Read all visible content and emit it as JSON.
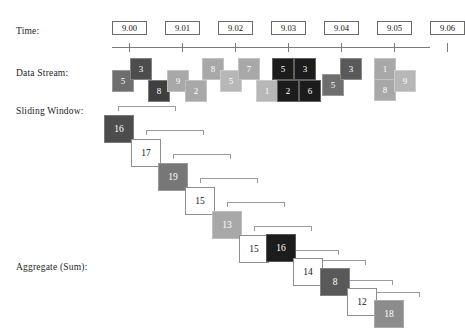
{
  "labels": {
    "time": "Time:",
    "data_stream": "Data Stream:",
    "sliding_window": "Sliding Window:",
    "aggregate": "Aggregate (Sum):"
  },
  "colors": {
    "very_dark": "#1c1c1c",
    "dark": "#3f3f3f",
    "mid_dark": "#595959",
    "mid": "#6e6e6e",
    "gray": "#8c8c8c",
    "light": "#a8a8a8",
    "lighter": "#b7b7b7",
    "axis": "#7a7a7a",
    "box_border": "#6a6a6a",
    "bracket": "#9a9a9a",
    "text_light": "#ffffff",
    "text_dark": "#141414",
    "background": "#ffffff"
  },
  "time_axis": {
    "ticks": [
      "9.00",
      "9.01",
      "9.02",
      "9.03",
      "9.04",
      "9.05",
      "9.06"
    ]
  },
  "chart_data": {
    "type": "diagram",
    "stream_values": [
      5,
      3,
      8,
      9,
      2,
      8,
      5,
      7,
      1,
      5,
      3,
      2,
      6,
      5,
      3,
      1,
      8,
      9
    ],
    "aggregate_values": [
      16,
      17,
      19,
      15,
      13,
      15,
      16,
      14,
      8,
      12,
      18
    ],
    "time_ticks": [
      "9.00",
      "9.01",
      "9.02",
      "9.03",
      "9.04",
      "9.05",
      "9.06"
    ]
  },
  "stream_blocks": [
    {
      "value": "5",
      "x": 112,
      "y": 70,
      "color": "#6e6e6e",
      "text": "#ffffff"
    },
    {
      "value": "3",
      "x": 130,
      "y": 58,
      "color": "#4d4d4d",
      "text": "#ffffff"
    },
    {
      "value": "8",
      "x": 148,
      "y": 80,
      "color": "#3f3f3f",
      "text": "#ffffff"
    },
    {
      "value": "9",
      "x": 167,
      "y": 70,
      "color": "#a8a8a8",
      "text": "#ffffff"
    },
    {
      "value": "2",
      "x": 185,
      "y": 80,
      "color": "#a8a8a8",
      "text": "#ffffff"
    },
    {
      "value": "8",
      "x": 202,
      "y": 58,
      "color": "#a8a8a8",
      "text": "#ffffff"
    },
    {
      "value": "5",
      "x": 220,
      "y": 70,
      "color": "#b7b7b7",
      "text": "#ffffff"
    },
    {
      "value": "7",
      "x": 238,
      "y": 58,
      "color": "#a8a8a8",
      "text": "#ffffff"
    },
    {
      "value": "1",
      "x": 256,
      "y": 80,
      "color": "#b7b7b7",
      "text": "#ffffff"
    },
    {
      "value": "5",
      "x": 272,
      "y": 58,
      "color": "#1c1c1c",
      "text": "#ffffff"
    },
    {
      "value": "3",
      "x": 294,
      "y": 58,
      "color": "#1c1c1c",
      "text": "#ffffff"
    },
    {
      "value": "2",
      "x": 277,
      "y": 80,
      "color": "#1c1c1c",
      "text": "#ffffff"
    },
    {
      "value": "6",
      "x": 299,
      "y": 80,
      "color": "#1c1c1c",
      "text": "#ffffff"
    },
    {
      "value": "5",
      "x": 322,
      "y": 74,
      "color": "#6e6e6e",
      "text": "#ffffff"
    },
    {
      "value": "3",
      "x": 340,
      "y": 58,
      "color": "#595959",
      "text": "#ffffff"
    },
    {
      "value": "1",
      "x": 374,
      "y": 58,
      "color": "#a8a8a8",
      "text": "#ffffff"
    },
    {
      "value": "8",
      "x": 374,
      "y": 79,
      "color": "#a8a8a8",
      "text": "#ffffff"
    },
    {
      "value": "9",
      "x": 394,
      "y": 70,
      "color": "#b7b7b7",
      "text": "#ffffff"
    }
  ],
  "aggregate_blocks": [
    {
      "value": "16",
      "x": 104,
      "y": 115,
      "style": "filled",
      "color": "#4d4d4d",
      "text": "#ffffff"
    },
    {
      "value": "17",
      "x": 131,
      "y": 139,
      "style": "open",
      "color": "#ffffff",
      "text": "#141414"
    },
    {
      "value": "19",
      "x": 158,
      "y": 163,
      "style": "filled",
      "color": "#777777",
      "text": "#ffffff"
    },
    {
      "value": "15",
      "x": 185,
      "y": 187,
      "style": "open",
      "color": "#ffffff",
      "text": "#141414"
    },
    {
      "value": "13",
      "x": 212,
      "y": 211,
      "style": "filled",
      "color": "#a8a8a8",
      "text": "#ffffff"
    },
    {
      "value": "15",
      "x": 239,
      "y": 235,
      "style": "open",
      "color": "#ffffff",
      "text": "#141414"
    },
    {
      "value": "16",
      "x": 266,
      "y": 234,
      "style": "filled",
      "color": "#1c1c1c",
      "text": "#ffffff"
    },
    {
      "value": "14",
      "x": 293,
      "y": 258,
      "style": "open",
      "color": "#ffffff",
      "text": "#141414"
    },
    {
      "value": "8",
      "x": 320,
      "y": 268,
      "style": "filled",
      "color": "#595959",
      "text": "#ffffff"
    },
    {
      "value": "12",
      "x": 347,
      "y": 288,
      "style": "open",
      "color": "#ffffff",
      "text": "#141414"
    },
    {
      "value": "18",
      "x": 374,
      "y": 300,
      "style": "filled",
      "color": "#8c8c8c",
      "text": "#ffffff"
    }
  ],
  "window_brackets": [
    {
      "x": 118,
      "y": 106,
      "w": 58
    },
    {
      "x": 146,
      "y": 130,
      "w": 58
    },
    {
      "x": 173,
      "y": 154,
      "w": 58
    },
    {
      "x": 200,
      "y": 178,
      "w": 58
    },
    {
      "x": 227,
      "y": 202,
      "w": 58
    },
    {
      "x": 254,
      "y": 226,
      "w": 58
    },
    {
      "x": 281,
      "y": 250,
      "w": 58
    },
    {
      "x": 308,
      "y": 260,
      "w": 58
    },
    {
      "x": 335,
      "y": 280,
      "w": 58
    },
    {
      "x": 362,
      "y": 292,
      "w": 58
    }
  ]
}
